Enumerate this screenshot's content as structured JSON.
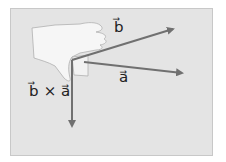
{
  "diagram": {
    "labels": {
      "b": "b⃗",
      "a": "a⃗",
      "cross": "b⃗ × a⃗"
    },
    "colors": {
      "background": "#e4e4e4",
      "arrow": "#707070",
      "hand": "#f4f4f4"
    },
    "vectors": [
      {
        "name": "b",
        "from": [
          72,
          60
        ],
        "to": [
          175,
          28
        ]
      },
      {
        "name": "a",
        "from": [
          72,
          60
        ],
        "to": [
          184,
          73
        ]
      },
      {
        "name": "b-cross-a",
        "from": [
          72,
          60
        ],
        "to": [
          72,
          128
        ]
      }
    ]
  }
}
